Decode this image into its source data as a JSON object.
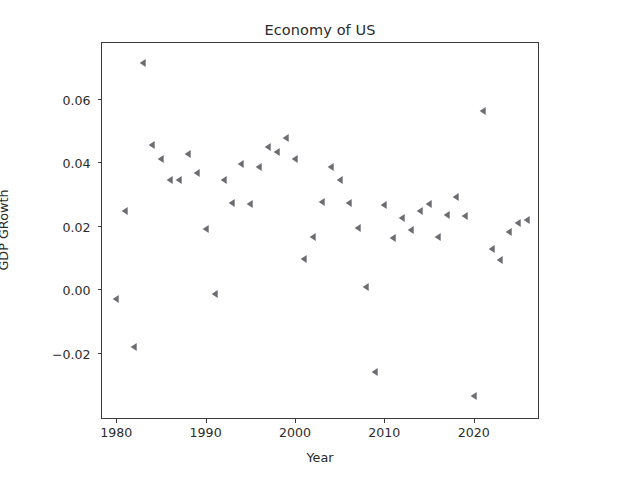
{
  "chart_data": {
    "type": "scatter",
    "title": "Economy of US",
    "xlabel": "Year",
    "ylabel": "GDP GRowth",
    "marker": "triangle-left",
    "marker_color": "#6c6c72",
    "grid": false,
    "legend": null,
    "xlim": [
      1978.4,
      2027.2
    ],
    "ylim": [
      -0.0405,
      0.0775
    ],
    "xticks": [
      1980,
      1990,
      2000,
      2010,
      2020
    ],
    "xtick_labels": [
      "1980",
      "1990",
      "2000",
      "2010",
      "2020"
    ],
    "yticks": [
      -0.02,
      0.0,
      0.02,
      0.04,
      0.06
    ],
    "ytick_labels": [
      "−0.02",
      "0.00",
      "0.02",
      "0.04",
      "0.06"
    ],
    "x": [
      1980,
      1981,
      1982,
      1983,
      1984,
      1985,
      1986,
      1987,
      1988,
      1989,
      1990,
      1991,
      1992,
      1993,
      1994,
      1995,
      1996,
      1997,
      1998,
      1999,
      2000,
      2001,
      2002,
      2003,
      2004,
      2005,
      2006,
      2007,
      2008,
      2009,
      2010,
      2011,
      2012,
      2013,
      2014,
      2015,
      2016,
      2017,
      2018,
      2019,
      2020,
      2021,
      2022,
      2023,
      2024,
      2025,
      2026
    ],
    "y": [
      -0.003,
      0.0247,
      -0.018,
      0.0713,
      0.0455,
      0.041,
      0.0345,
      0.0345,
      0.0425,
      0.0365,
      0.019,
      -0.0015,
      0.0345,
      0.0272,
      0.0395,
      0.0267,
      0.0385,
      0.0448,
      0.0432,
      0.0475,
      0.041,
      0.0095,
      0.0165,
      0.0275,
      0.0385,
      0.0345,
      0.0272,
      0.0192,
      0.0008,
      -0.026,
      0.0265,
      0.0162,
      0.0223,
      0.0187,
      0.0245,
      0.0268,
      0.0165,
      0.0235,
      0.029,
      0.0232,
      -0.0335,
      0.0562,
      0.0127,
      0.0093,
      0.018,
      0.0208,
      0.0218
    ],
    "series_name": "GDP Growth"
  },
  "axes": {
    "title": "Economy of US",
    "xlabel": "Year",
    "ylabel": "GDP GRowth"
  }
}
